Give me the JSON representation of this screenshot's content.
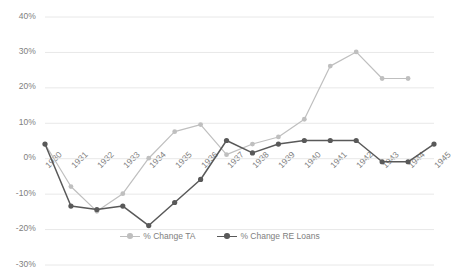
{
  "chart_data": {
    "type": "line",
    "title": "",
    "subtitle": "",
    "xlabel": "",
    "ylabel": "",
    "categories": [
      "1930",
      "1931",
      "1932",
      "1933",
      "1934",
      "1935",
      "1936",
      "1937",
      "1938",
      "1939",
      "1940",
      "1941",
      "1942",
      "1943",
      "1944",
      "1945"
    ],
    "ylim": [
      -30,
      40
    ],
    "ytick_labels": [
      "40%",
      "30%",
      "20%",
      "10%",
      "0%",
      "-10%",
      "-20%",
      "-30%"
    ],
    "ytick_values": [
      40,
      30,
      20,
      10,
      0,
      -10,
      -20,
      -30
    ],
    "grid": "horizontal",
    "legend_position": "bottom",
    "series": [
      {
        "name": "% Change TA",
        "color": "#bfbfbf",
        "values": [
          4,
          -8,
          -15,
          -10,
          0,
          7.5,
          9.5,
          1,
          4,
          6,
          11,
          26,
          30,
          22.5,
          22.5,
          null
        ]
      },
      {
        "name": "% Change RE Loans",
        "color": "#595959",
        "values": [
          4,
          -13.5,
          -14.5,
          -13.5,
          -19,
          -12.5,
          -6,
          5,
          1.5,
          4,
          5,
          5,
          5,
          -1,
          -1,
          4
        ]
      }
    ]
  },
  "legend": {
    "items": [
      {
        "label": "% Change TA"
      },
      {
        "label": "% Change RE Loans"
      }
    ]
  }
}
